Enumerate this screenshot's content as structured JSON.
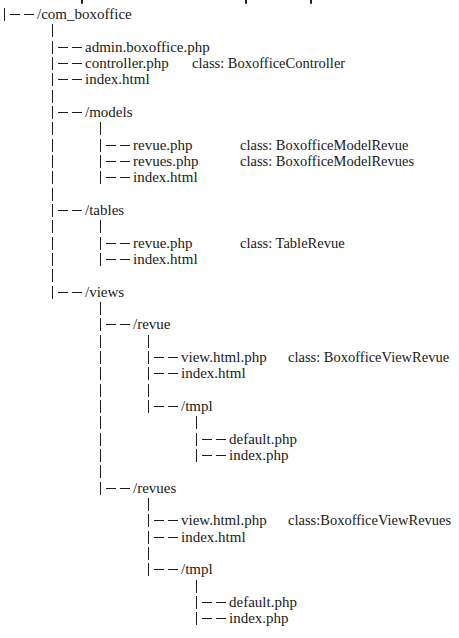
{
  "tree": {
    "root": {
      "label": "/com_boxoffice"
    },
    "level1": {
      "admin": {
        "label": "admin.boxoffice.php"
      },
      "controller": {
        "label": "controller.php",
        "class": "class: BoxofficeController"
      },
      "index": {
        "label": "index.html"
      },
      "models": {
        "label": "/models"
      },
      "tables": {
        "label": "/tables"
      },
      "views": {
        "label": "/views"
      }
    },
    "models": {
      "revue": {
        "label": "revue.php",
        "class": "class: BoxofficeModelRevue"
      },
      "revues": {
        "label": "revues.php",
        "class": "class: BoxofficeModelRevues"
      },
      "index": {
        "label": "index.html"
      }
    },
    "tables": {
      "revue": {
        "label": "revue.php",
        "class": "class: TableRevue"
      },
      "index": {
        "label": "index.html"
      }
    },
    "views": {
      "revue": {
        "label": "/revue",
        "view": {
          "label": "view.html.php",
          "class": "class: BoxofficeViewRevue"
        },
        "index": {
          "label": "index.html"
        },
        "tmpl": {
          "label": "/tmpl",
          "default": {
            "label": "default.php"
          },
          "index": {
            "label": "index.php"
          }
        }
      },
      "revues": {
        "label": "/revues",
        "view": {
          "label": "view.html.php",
          "class": "class:BoxofficeViewRevues"
        },
        "index": {
          "label": "index.html"
        },
        "tmpl": {
          "label": "/tmpl",
          "default": {
            "label": "default.php"
          },
          "index": {
            "label": "index.php"
          }
        }
      }
    }
  },
  "colors": {
    "ink": "#1a1a1a",
    "background": "#ffffff"
  }
}
